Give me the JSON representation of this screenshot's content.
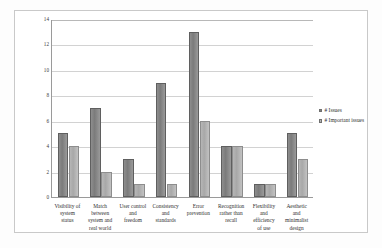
{
  "chart_data": {
    "type": "bar",
    "title": "",
    "subtitle": "",
    "xlabel": "",
    "ylabel": "",
    "ylim": [
      0,
      14
    ],
    "yticks": [
      0,
      2,
      4,
      6,
      8,
      10,
      12,
      14
    ],
    "grid": true,
    "legend_position": "right",
    "categories": [
      "Visibility of system status",
      "Match between system and real world",
      "User control and freedom",
      "Consistency and standards",
      "Error prevention",
      "Recognition rather than recall",
      "Flexibility and efficiency of use",
      "Aesthetic and minimalist design"
    ],
    "category_lines": [
      [
        "Visibility of",
        "system",
        "status"
      ],
      [
        "Match",
        "between",
        "system and",
        "real world"
      ],
      [
        "User control",
        "and",
        "freedom"
      ],
      [
        "Consistency",
        "and",
        "standards"
      ],
      [
        "Error",
        "prevention"
      ],
      [
        "Recognition",
        "rather than",
        "recall"
      ],
      [
        "Flexibility",
        "and",
        "efficiency",
        "of use"
      ],
      [
        "Aesthetic",
        "and",
        "minimalist",
        "design"
      ]
    ],
    "series": [
      {
        "name": "# Issues",
        "color": "#808080",
        "values": [
          5,
          7,
          3,
          9,
          13,
          4,
          1,
          5
        ]
      },
      {
        "name": "# Important issues",
        "color": "#b5b5b5",
        "values": [
          4,
          2,
          1,
          1,
          6,
          4,
          1,
          3
        ]
      }
    ]
  },
  "legend": {
    "entries": [
      {
        "label": "# Issues"
      },
      {
        "label": "# Important issues"
      }
    ]
  },
  "colors": {
    "series_1": "#808080",
    "series_2": "#b5b5b5",
    "axis": "#9a9a9a",
    "grid": "#d2d2d2",
    "frame": "#c9c9c9",
    "text": "#2f2f2f"
  }
}
